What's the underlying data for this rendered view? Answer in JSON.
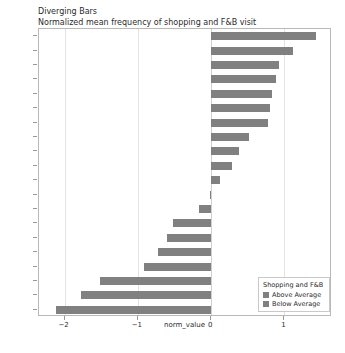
{
  "chart_data": {
    "type": "bar",
    "orientation": "horizontal",
    "title": "Diverging Bars",
    "subtitle": "Normalized mean frequency of shopping and F&B visit",
    "xlabel": "norm_value",
    "ylabel": "",
    "xlim": [
      -2.35,
      1.65
    ],
    "xticks": [
      -2,
      -1,
      0,
      1
    ],
    "xtick_labels": [
      "−2",
      "−1",
      "0",
      "1"
    ],
    "grid": true,
    "grid_axis": "x",
    "legend_position": "lower right",
    "categories": [
      "C1S2",
      "C1S3",
      "C1S1",
      "C7S3",
      "C2S1",
      "C6S2",
      "C5S1",
      "C6S3",
      "C8S3",
      "C2S2",
      "C6S1",
      "C4S1",
      "C5S2",
      "C3S2",
      "C8S1",
      "C7S2",
      "C6S2b",
      "C7S1",
      "C4S2",
      "C3S1"
    ],
    "values": [
      1.43,
      1.12,
      0.92,
      0.88,
      0.83,
      0.8,
      0.77,
      0.52,
      0.38,
      0.28,
      0.12,
      -0.02,
      -0.16,
      -0.52,
      -0.6,
      -0.72,
      -0.92,
      -1.52,
      -1.78,
      -2.12
    ],
    "series": [
      {
        "name": "Above Average",
        "color": "#808080",
        "condition": "norm_value >= 0"
      },
      {
        "name": "Below Average",
        "color": "#808080",
        "condition": "norm_value < 0"
      }
    ]
  },
  "legend": {
    "title": "Shopping and F&B",
    "entries": [
      {
        "label": "Above Average",
        "color": "#808080"
      },
      {
        "label": "Below Average",
        "color": "#808080"
      }
    ]
  },
  "colors": {
    "bar": "#808080",
    "grid": "#e3e3e3",
    "frame": "#b8b8b8",
    "text": "#2b2b2b"
  }
}
